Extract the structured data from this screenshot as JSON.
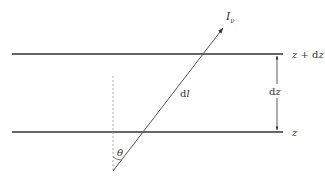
{
  "diagram": {
    "type": "slab-ray-geometry",
    "labels": {
      "intensity": "I",
      "intensity_sub": "ν",
      "top_boundary": "z + dz",
      "bottom_boundary": "z",
      "path_element": "dl",
      "thickness": "dz",
      "angle": "θ"
    },
    "colors": {
      "boundary_line": "#333333",
      "ray": "#555555",
      "dashed_normal": "#999999",
      "text": "#333333"
    }
  }
}
